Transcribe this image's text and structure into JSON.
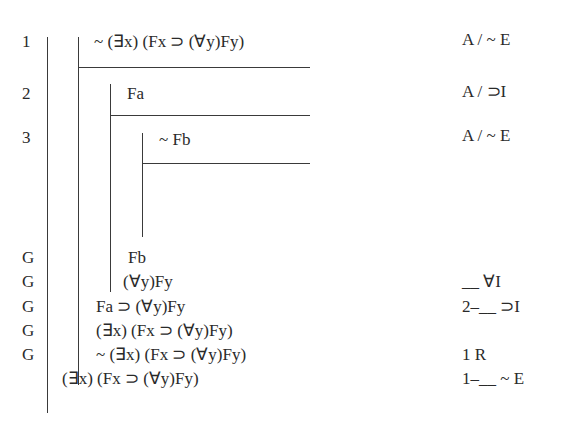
{
  "proof": {
    "lines": [
      {
        "number": "1",
        "formula": "~ (∃x) (Fx ⊃ (∀y)Fy)",
        "justification": "A / ~ E"
      },
      {
        "number": "2",
        "formula": "Fa",
        "justification": "A / ⊃I"
      },
      {
        "number": "3",
        "formula": "~ Fb",
        "justification": "A / ~ E"
      },
      {
        "number": "G",
        "formula": "Fb",
        "justification": ""
      },
      {
        "number": "G",
        "formula": "(∀y)Fy",
        "justification": "__ ∀I"
      },
      {
        "number": "G",
        "formula": "Fa ⊃ (∀y)Fy",
        "justification": "2–__ ⊃I"
      },
      {
        "number": "G",
        "formula": "(∃x) (Fx ⊃ (∀y)Fy)",
        "justification": ""
      },
      {
        "number": "G",
        "formula": "~ (∃x) (Fx ⊃ (∀y)Fy)",
        "justification": "1 R"
      },
      {
        "number": "",
        "formula": "(∃x) (Fx ⊃ (∀y)Fy)",
        "justification": "1–__ ~ E"
      }
    ]
  }
}
